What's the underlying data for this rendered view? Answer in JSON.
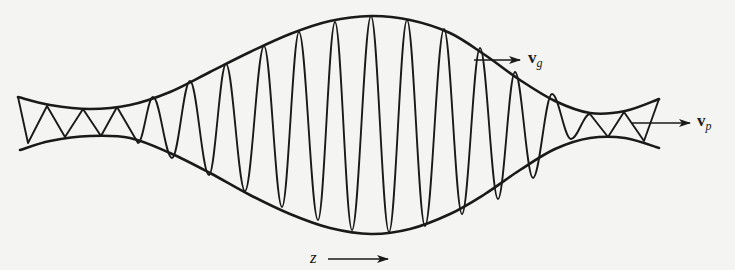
{
  "figure": {
    "labels": {
      "group_velocity": {
        "symbol": "v",
        "subscript": "g"
      },
      "phase_velocity": {
        "symbol": "v",
        "subscript": "p"
      },
      "axis": {
        "symbol": "z"
      }
    },
    "colors": {
      "ink": "#1a1a1a",
      "paper": "#f4f4f2"
    },
    "envelope": {
      "upper": [
        [
          18,
          97
        ],
        [
          50,
          105
        ],
        [
          90,
          109
        ],
        [
          130,
          105
        ],
        [
          170,
          92
        ],
        [
          210,
          72
        ],
        [
          250,
          52
        ],
        [
          290,
          34
        ],
        [
          330,
          21
        ],
        [
          371,
          16
        ],
        [
          410,
          20
        ],
        [
          450,
          33
        ],
        [
          485,
          55
        ],
        [
          520,
          80
        ],
        [
          555,
          101
        ],
        [
          590,
          113
        ],
        [
          625,
          111
        ],
        [
          659,
          99
        ]
      ],
      "lower": [
        [
          20,
          150
        ],
        [
          50,
          141
        ],
        [
          90,
          136
        ],
        [
          130,
          138
        ],
        [
          170,
          153
        ],
        [
          210,
          173
        ],
        [
          250,
          195
        ],
        [
          290,
          214
        ],
        [
          330,
          228
        ],
        [
          371,
          234
        ],
        [
          410,
          229
        ],
        [
          450,
          214
        ],
        [
          485,
          194
        ],
        [
          520,
          170
        ],
        [
          555,
          149
        ],
        [
          590,
          138
        ],
        [
          625,
          138
        ],
        [
          659,
          148
        ]
      ]
    },
    "carrier": {
      "extrema": [
        [
          18,
          97
        ],
        [
          28,
          143
        ],
        [
          47,
          106
        ],
        [
          65,
          137
        ],
        [
          83,
          109
        ],
        [
          101,
          136
        ],
        [
          117,
          107
        ],
        [
          138,
          143
        ],
        [
          153,
          97
        ],
        [
          172,
          158
        ],
        [
          190,
          81
        ],
        [
          209,
          175
        ],
        [
          226,
          64
        ],
        [
          245,
          191
        ],
        [
          264,
          46
        ],
        [
          282,
          207
        ],
        [
          299,
          32
        ],
        [
          318,
          220
        ],
        [
          335,
          22
        ],
        [
          352,
          230
        ],
        [
          371,
          16
        ],
        [
          389,
          232
        ],
        [
          407,
          20
        ],
        [
          425,
          226
        ],
        [
          444,
          29
        ],
        [
          462,
          214
        ],
        [
          480,
          48
        ],
        [
          498,
          199
        ],
        [
          515,
          72
        ],
        [
          533,
          178
        ],
        [
          552,
          94
        ],
        [
          571,
          139
        ],
        [
          590,
          114
        ],
        [
          608,
          137
        ],
        [
          624,
          112
        ],
        [
          644,
          141
        ],
        [
          659,
          99
        ]
      ],
      "rounded_from_index": 7,
      "rounded_until_index": 32
    },
    "arrows": {
      "vg": {
        "x1": 474,
        "y1": 60,
        "x2": 520,
        "y2": 60,
        "label_x": 528,
        "label_y": 48
      },
      "vp": {
        "x1": 632,
        "y1": 123,
        "x2": 690,
        "y2": 123,
        "label_x": 697,
        "label_y": 111
      },
      "z": {
        "x1": 328,
        "y1": 259,
        "x2": 388,
        "y2": 259,
        "label_x": 310,
        "label_y": 248
      }
    }
  }
}
